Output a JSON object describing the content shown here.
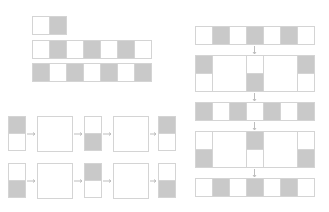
{
  "colors": {
    "fill_gray": "#c9c9c9",
    "fill_white": "#ffffff",
    "stroke": "#d4d4d4",
    "arrow": "#bdbdbd"
  },
  "top_left_rows": [
    [
      0,
      1
    ],
    [
      0,
      1,
      0,
      1,
      0,
      1,
      0
    ],
    [
      1,
      0,
      1,
      0,
      1,
      0,
      1
    ]
  ],
  "bottom_left_pipelines": [
    {
      "stages": [
        {
          "type": "column",
          "cells": [
            1,
            0
          ]
        },
        {
          "type": "box"
        },
        {
          "type": "column",
          "cells": [
            0,
            1
          ]
        },
        {
          "type": "box"
        },
        {
          "type": "column",
          "cells": [
            1,
            0
          ]
        }
      ]
    },
    {
      "stages": [
        {
          "type": "column",
          "cells": [
            0,
            1
          ]
        },
        {
          "type": "box"
        },
        {
          "type": "column",
          "cells": [
            1,
            0
          ]
        },
        {
          "type": "box"
        },
        {
          "type": "column",
          "cells": [
            0,
            1
          ]
        }
      ]
    }
  ],
  "right_stack": [
    {
      "type": "row",
      "cells": [
        0,
        1,
        0,
        1,
        0,
        1,
        0
      ]
    },
    {
      "type": "block",
      "columns": [
        [
          1,
          0
        ],
        "box",
        [
          0,
          1
        ],
        "box",
        [
          1,
          0
        ]
      ]
    },
    {
      "type": "row",
      "cells": [
        1,
        0,
        1,
        0,
        1,
        0,
        1
      ]
    },
    {
      "type": "block",
      "columns": [
        [
          0,
          1
        ],
        "box",
        [
          1,
          0
        ],
        "box",
        [
          0,
          1
        ]
      ]
    },
    {
      "type": "row",
      "cells": [
        0,
        1,
        0,
        1,
        0,
        1,
        0
      ]
    }
  ]
}
